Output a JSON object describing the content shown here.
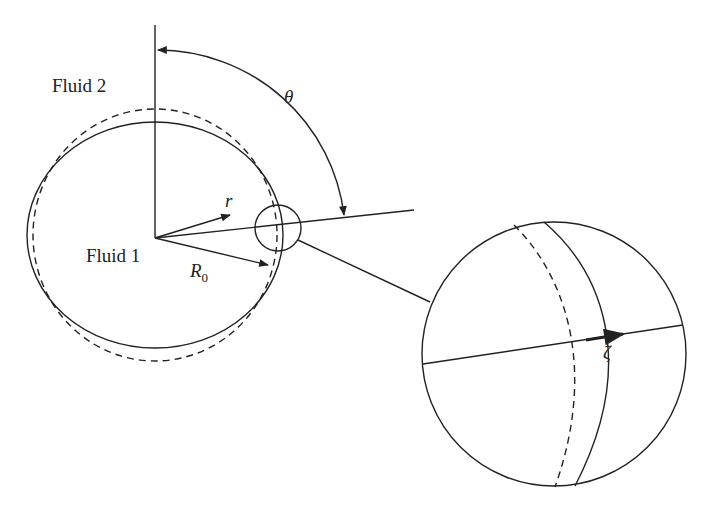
{
  "diagram": {
    "labels": {
      "fluid_outer": "Fluid 2",
      "fluid_inner": "Fluid 1",
      "angle": "θ",
      "radial": "r",
      "radius": "R",
      "radius_sub": "0",
      "displacement": "ζ"
    },
    "colors": {
      "stroke": "#222222",
      "background": "#ffffff"
    },
    "elements": [
      "perturbed interface (solid ellipse)",
      "unperturbed interface (dashed circle)",
      "polar axis",
      "angle arc θ",
      "radial arrow r",
      "radius arrow R0",
      "magnified view circle",
      "displacement arrow ζ"
    ]
  }
}
